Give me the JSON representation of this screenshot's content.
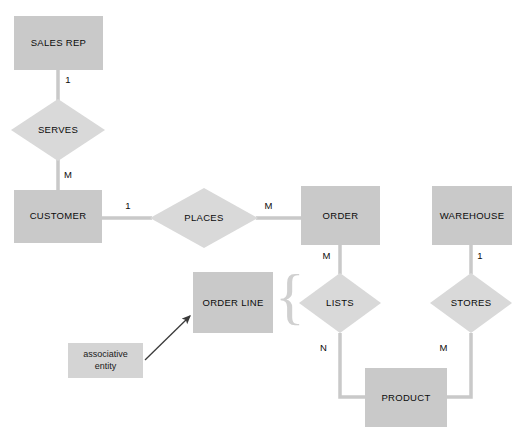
{
  "diagram": {
    "colors": {
      "entity_fill": "#c9c9c9",
      "relationship_fill": "#d9d9d9",
      "note_fill": "#d4d4d4",
      "connector": "#c9c9c9",
      "text": "#0b0b0b",
      "background": "#ffffff",
      "arrow": "#3a3a3a",
      "brace": "#d0d0d0"
    },
    "entities": [
      {
        "id": "sales-rep",
        "label": "SALES REP",
        "x": 14,
        "y": 16,
        "w": 89,
        "h": 54
      },
      {
        "id": "customer",
        "label": "CUSTOMER",
        "x": 14,
        "y": 190,
        "w": 88,
        "h": 53
      },
      {
        "id": "order",
        "label": "ORDER",
        "x": 301,
        "y": 186,
        "w": 79,
        "h": 59
      },
      {
        "id": "warehouse",
        "label": "WAREHOUSE",
        "x": 432,
        "y": 186,
        "w": 80,
        "h": 59
      },
      {
        "id": "order-line",
        "label": "ORDER LINE",
        "x": 193,
        "y": 272,
        "w": 80,
        "h": 61
      },
      {
        "id": "product",
        "label": "PRODUCT",
        "x": 365,
        "y": 368,
        "w": 82,
        "h": 59
      }
    ],
    "relationships": [
      {
        "id": "serves",
        "label": "SERVES",
        "cx": 58,
        "cy": 130,
        "rx": 47,
        "ry": 31
      },
      {
        "id": "places",
        "label": "PLACES",
        "cx": 204,
        "cy": 218,
        "rx": 54,
        "ry": 30
      },
      {
        "id": "lists",
        "label": "LISTS",
        "cx": 340,
        "cy": 303,
        "rx": 41,
        "ry": 30
      },
      {
        "id": "stores",
        "label": "STORES",
        "cx": 471,
        "cy": 303,
        "rx": 41,
        "ry": 30
      }
    ],
    "cardinalities": [
      {
        "id": "sales-rep-serves",
        "value": "1",
        "x": 68,
        "y": 74
      },
      {
        "id": "serves-customer",
        "value": "M",
        "x": 68,
        "y": 169
      },
      {
        "id": "customer-places",
        "value": "1",
        "x": 128,
        "y": 200
      },
      {
        "id": "places-order",
        "value": "M",
        "x": 268,
        "y": 200
      },
      {
        "id": "order-lists",
        "value": "M",
        "x": 326,
        "y": 250
      },
      {
        "id": "lists-product",
        "value": "N",
        "x": 323,
        "y": 342
      },
      {
        "id": "warehouse-stores",
        "value": "1",
        "x": 477,
        "y": 250
      },
      {
        "id": "stores-product",
        "value": "M",
        "x": 441,
        "y": 342
      }
    ],
    "annotation": {
      "id": "associative-entity-note",
      "line1": "associative",
      "line2": "entity",
      "x": 68,
      "y": 343,
      "w": 75,
      "h": 35,
      "arrow": {
        "x1": 145,
        "y1": 360,
        "x2": 192,
        "y2": 314
      }
    },
    "brace": {
      "id": "order-line-brace",
      "glyph": "{",
      "x": 278,
      "y": 272,
      "h": 64
    }
  }
}
